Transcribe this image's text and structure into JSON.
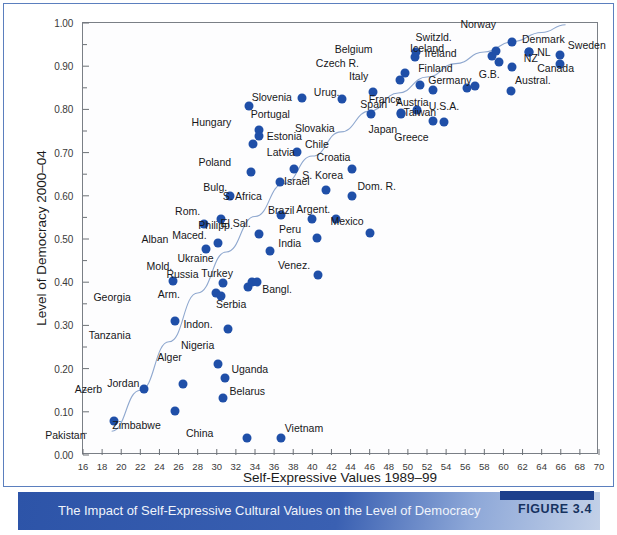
{
  "figure": {
    "caption": "The Impact of Self-Expressive Cultural Values on the Level of Democracy",
    "badge": "FIGURE 3.4",
    "accent_color": "#2d54a8",
    "dot_color": "#1f4fa8",
    "trend_color": "#8fa8cf"
  },
  "chart_data": {
    "type": "scatter",
    "title": "The Impact of Self-Expressive Cultural Values on the Level of Democracy",
    "xlabel": "Self-Expressive Values 1989–99",
    "ylabel": "Level of Democracy 2000–04",
    "xlim": [
      16,
      70
    ],
    "ylim": [
      0.0,
      1.0
    ],
    "xticks": [
      16,
      18,
      20,
      22,
      24,
      26,
      28,
      30,
      32,
      34,
      36,
      38,
      40,
      42,
      44,
      46,
      48,
      50,
      52,
      54,
      56,
      58,
      60,
      62,
      64,
      66,
      68,
      70
    ],
    "xtick_labels": [
      "16",
      "18",
      "20",
      "22",
      "24",
      "26",
      "28",
      "30",
      "32",
      "34",
      "36",
      "38",
      "40",
      "42",
      "44",
      "46",
      "48",
      "50",
      "52",
      "54",
      "56",
      "58",
      "60",
      "62",
      "64",
      "66",
      "68",
      "70"
    ],
    "yticks": [
      0.0,
      0.1,
      0.2,
      0.3,
      0.4,
      0.5,
      0.6,
      0.7,
      0.8,
      0.9,
      1.0
    ],
    "ytick_labels": [
      "0.00",
      "0.10",
      "0.20",
      "0.30",
      "0.40",
      "0.50",
      "0.60",
      "0.70",
      "0.80",
      "0.90",
      "1.00"
    ],
    "y_minor_tick_step": 0.05,
    "grid": false,
    "legend": "none",
    "trendline": {
      "present": true,
      "style": "smooth curve",
      "description": "Upward-sloping fitted curve rising from near (19, 0.07) through the middle of the cloud and flattening toward (66, 1.00)"
    },
    "points": [
      {
        "label": "Pakistan",
        "x": 19.2,
        "y": 0.078,
        "lx": -28,
        "ly": 14
      },
      {
        "label": "Azerb",
        "x": 22.4,
        "y": 0.153,
        "lx": -42,
        "ly": 0
      },
      {
        "label": "Georgia",
        "x": 25.4,
        "y": 0.402,
        "lx": -42,
        "ly": 16
      },
      {
        "label": "Tanzania",
        "x": 25.6,
        "y": 0.311,
        "lx": -44,
        "ly": 14
      },
      {
        "label": "Zimbabwe",
        "x": 25.6,
        "y": 0.103,
        "lx": -14,
        "ly": 14
      },
      {
        "label": "Jordan",
        "x": 26.5,
        "y": 0.165,
        "lx": -44,
        "ly": -1
      },
      {
        "label": "Alban",
        "x": 28.7,
        "y": 0.535,
        "lx": -36,
        "ly": 15
      },
      {
        "label": "Mold.",
        "x": 28.9,
        "y": 0.478,
        "lx": -34,
        "ly": 17
      },
      {
        "label": "Arm.",
        "x": 29.9,
        "y": 0.374,
        "lx": -36,
        "ly": 1
      },
      {
        "label": "Alger",
        "x": 30.1,
        "y": 0.211,
        "lx": -36,
        "ly": -7
      },
      {
        "label": "Ukraine",
        "x": 30.1,
        "y": 0.49,
        "lx": -4,
        "ly": 15
      },
      {
        "label": "Maced.",
        "x": 30.4,
        "y": 0.547,
        "lx": -14,
        "ly": 16
      },
      {
        "label": "Russia",
        "x": 30.6,
        "y": 0.397,
        "lx": -24,
        "ly": -9
      },
      {
        "label": "Belarus",
        "x": 30.7,
        "y": 0.131,
        "lx": 6,
        "ly": -7
      },
      {
        "label": "Uganda",
        "x": 30.9,
        "y": 0.179,
        "lx": 6,
        "ly": -9
      },
      {
        "label": "Nigeria",
        "x": 31.2,
        "y": 0.291,
        "lx": -14,
        "ly": 16
      },
      {
        "label": "Rom.",
        "x": 31.4,
        "y": 0.599,
        "lx": -30,
        "ly": 15
      },
      {
        "label": "China",
        "x": 33.2,
        "y": 0.039,
        "lx": -34,
        "ly": -5
      },
      {
        "label": "Indon.",
        "x": 30.4,
        "y": 0.368,
        "lx": -8,
        "ly": 28
      },
      {
        "label": "Serbia",
        "x": 33.3,
        "y": 0.39,
        "lx": -2,
        "ly": 17
      },
      {
        "label": "Bangl.",
        "x": 33.7,
        "y": 0.4,
        "lx": 10,
        "ly": 7
      },
      {
        "label": "Turkey",
        "x": 34.2,
        "y": 0.401,
        "lx": -24,
        "ly": -9
      },
      {
        "label": "Bulg.",
        "x": 33.6,
        "y": 0.655,
        "lx": -24,
        "ly": 15
      },
      {
        "label": "Philipp.",
        "x": 34.4,
        "y": 0.511,
        "lx": -26,
        "ly": -9
      },
      {
        "label": "India",
        "x": 35.6,
        "y": 0.473,
        "lx": 8,
        "ly": -8
      },
      {
        "label": "Vietnam",
        "x": 36.7,
        "y": 0.039,
        "lx": 4,
        "ly": -10
      },
      {
        "label": "Hungary",
        "x": 33.4,
        "y": 0.808,
        "lx": -18,
        "ly": 16
      },
      {
        "label": "Estonia",
        "x": 34.4,
        "y": 0.753,
        "lx": 8,
        "ly": 6
      },
      {
        "label": "Latvia",
        "x": 34.4,
        "y": 0.738,
        "lx": 8,
        "ly": 16
      },
      {
        "label": "Poland",
        "x": 33.8,
        "y": 0.721,
        "lx": -22,
        "ly": 18
      },
      {
        "label": "El Sal.",
        "x": 36.7,
        "y": 0.556,
        "lx": -30,
        "ly": 8
      },
      {
        "label": "S. Africa",
        "x": 36.6,
        "y": 0.633,
        "lx": -18,
        "ly": 14
      },
      {
        "label": "S. Korea",
        "x": 38.1,
        "y": 0.663,
        "lx": 8,
        "ly": 6
      },
      {
        "label": "Chile",
        "x": 38.4,
        "y": 0.701,
        "lx": 8,
        "ly": -8
      },
      {
        "label": "Portugal",
        "x": 38.9,
        "y": 0.827,
        "lx": -12,
        "ly": 16
      },
      {
        "label": "Brazil",
        "x": 40.0,
        "y": 0.547,
        "lx": -18,
        "ly": -9
      },
      {
        "label": "Peru",
        "x": 40.5,
        "y": 0.502,
        "lx": -16,
        "ly": -9
      },
      {
        "label": "Venez.",
        "x": 40.6,
        "y": 0.417,
        "lx": -8,
        "ly": -10
      },
      {
        "label": "Israel",
        "x": 41.4,
        "y": 0.614,
        "lx": -16,
        "ly": -9
      },
      {
        "label": "Argent.",
        "x": 42.5,
        "y": 0.547,
        "lx": -6,
        "ly": -10
      },
      {
        "label": "Slovenia",
        "x": 43.1,
        "y": 0.824,
        "lx": -50,
        "ly": -2
      },
      {
        "label": "Dom. R.",
        "x": 44.1,
        "y": 0.6,
        "lx": 6,
        "ly": -10
      },
      {
        "label": "Croatia",
        "x": 44.2,
        "y": 0.663,
        "lx": -2,
        "ly": -12
      },
      {
        "label": "Mexico",
        "x": 46.0,
        "y": 0.513,
        "lx": -6,
        "ly": -12
      },
      {
        "label": "Slovakia",
        "x": 46.1,
        "y": 0.789,
        "lx": -36,
        "ly": 14
      },
      {
        "label": "Urug.",
        "x": 46.4,
        "y": 0.841,
        "lx": -34,
        "ly": 0
      },
      {
        "label": "Italy",
        "x": 49.2,
        "y": 0.869,
        "lx": -32,
        "ly": -4
      },
      {
        "label": "Czech R.",
        "x": 49.7,
        "y": 0.884,
        "lx": -46,
        "ly": -10
      },
      {
        "label": "Japan",
        "x": 49.3,
        "y": 0.792,
        "lx": -4,
        "ly": 16
      },
      {
        "label": "Spain",
        "x": 49.3,
        "y": 0.79,
        "lx": -14,
        "ly": -10
      },
      {
        "label": "Belgium",
        "x": 50.7,
        "y": 0.922,
        "lx": -42,
        "ly": -8
      },
      {
        "label": "Ireland",
        "x": 50.9,
        "y": 0.932,
        "lx": 8,
        "ly": 1
      },
      {
        "label": "Germany",
        "x": 51.3,
        "y": 0.857,
        "lx": 8,
        "ly": -5
      },
      {
        "label": "France",
        "x": 51.0,
        "y": 0.798,
        "lx": -16,
        "ly": -11
      },
      {
        "label": "Austria",
        "x": 52.6,
        "y": 0.844,
        "lx": -4,
        "ly": 12
      },
      {
        "label": "Greece",
        "x": 52.6,
        "y": 0.773,
        "lx": -4,
        "ly": 16
      },
      {
        "label": "Taiwan",
        "x": 53.8,
        "y": 0.77,
        "lx": -8,
        "ly": -10
      },
      {
        "label": "Iceland",
        "x": 58.8,
        "y": 0.923,
        "lx": -48,
        "ly": -8
      },
      {
        "label": "Switzld.",
        "x": 59.2,
        "y": 0.935,
        "lx": -44,
        "ly": -14
      },
      {
        "label": "Finland",
        "x": 59.5,
        "y": 0.91,
        "lx": -46,
        "ly": 6
      },
      {
        "label": "Norway",
        "x": 60.9,
        "y": 0.956,
        "lx": -16,
        "ly": -18
      },
      {
        "label": "Denmark",
        "x": 60.9,
        "y": 0.897,
        "lx": 10,
        "ly": -28
      },
      {
        "label": "U.S.A.",
        "x": 56.2,
        "y": 0.85,
        "lx": -8,
        "ly": 18
      },
      {
        "label": "G.B.",
        "x": 57.0,
        "y": 0.854,
        "lx": 4,
        "ly": -12
      },
      {
        "label": "Austral.",
        "x": 60.8,
        "y": 0.842,
        "lx": 4,
        "ly": -11
      },
      {
        "label": "Canada",
        "x": 62.7,
        "y": 0.932,
        "lx": 8,
        "ly": 16
      },
      {
        "label": "NL",
        "x": 62.7,
        "y": 0.932,
        "lx": 8,
        "ly": 0
      },
      {
        "label": "NZ",
        "x": 65.9,
        "y": 0.905,
        "lx": -22,
        "ly": -6
      },
      {
        "label": "Sweden",
        "x": 65.9,
        "y": 0.925,
        "lx": 8,
        "ly": -10
      }
    ]
  }
}
